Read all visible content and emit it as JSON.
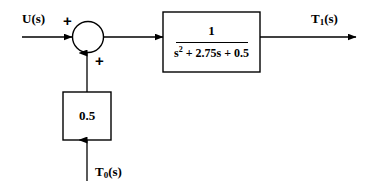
{
  "diagram": {
    "type": "control-system-block-diagram",
    "line_color": "#000000",
    "background_color": "#ffffff",
    "signals": {
      "input_label": "U(s)",
      "output_label_base": "T",
      "output_label_sub": "1",
      "output_label_tail": "(s)",
      "disturbance_label_base": "T",
      "disturbance_label_sub": "0",
      "disturbance_label_tail": "(s)"
    },
    "summing_junction": {
      "name": "summing-junction",
      "sign_input": "+",
      "sign_feedback": "+"
    },
    "plant_block": {
      "numerator": "1",
      "denominator_a": "s",
      "denominator_exp": "2",
      "denominator_b": " + 2.75s + 0.5"
    },
    "gain_block": {
      "value": "0.5"
    }
  }
}
